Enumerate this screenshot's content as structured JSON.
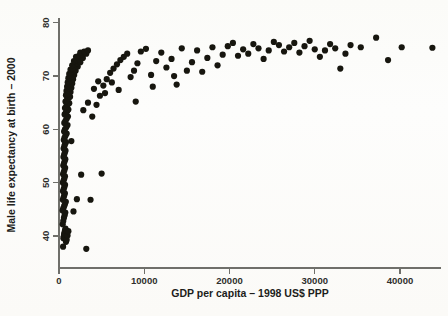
{
  "figure": {
    "background_color": "#fdfdfb",
    "point_color": "#17160f",
    "axis_color": "#6f6f6a",
    "text_color": "#1d1d1b"
  },
  "chart_data": {
    "type": "scatter",
    "title": "",
    "xlabel": "GDP per capita – 1998 US$ PPP",
    "ylabel": "Male life expectancy at birth – 2000",
    "xlim": [
      -1500,
      45500
    ],
    "ylim": [
      36.2,
      81.5
    ],
    "xticks": [
      0,
      10000,
      20000,
      30000,
      40000
    ],
    "xtick_labels": [
      "0",
      "10000",
      "20000",
      "30000",
      "40000"
    ],
    "yticks": [
      40,
      50,
      60,
      70,
      80
    ],
    "ytick_labels": [
      "40",
      "50",
      "60",
      "70",
      "80"
    ],
    "grid": false,
    "legend": null,
    "marker": "filled-circle",
    "marker_size_px": 4.0,
    "n_points": 191,
    "points": [
      [
        480,
        38.0
      ],
      [
        520,
        39.6
      ],
      [
        560,
        39.9
      ],
      [
        600,
        40.3
      ],
      [
        640,
        40.6
      ],
      [
        700,
        41.0
      ],
      [
        760,
        41.4
      ],
      [
        820,
        38.9
      ],
      [
        900,
        39.3
      ],
      [
        1000,
        40.1
      ],
      [
        1100,
        40.9
      ],
      [
        430,
        42.2
      ],
      [
        500,
        42.8
      ],
      [
        580,
        43.4
      ],
      [
        660,
        43.9
      ],
      [
        740,
        44.4
      ],
      [
        420,
        44.8
      ],
      [
        500,
        45.2
      ],
      [
        600,
        45.6
      ],
      [
        700,
        46.0
      ],
      [
        800,
        46.4
      ],
      [
        450,
        46.8
      ],
      [
        530,
        47.2
      ],
      [
        610,
        47.6
      ],
      [
        690,
        48.0
      ],
      [
        470,
        48.4
      ],
      [
        550,
        48.8
      ],
      [
        630,
        49.2
      ],
      [
        710,
        49.6
      ],
      [
        460,
        50.0
      ],
      [
        540,
        50.4
      ],
      [
        620,
        50.8
      ],
      [
        700,
        51.2
      ],
      [
        480,
        51.6
      ],
      [
        560,
        52.0
      ],
      [
        640,
        52.4
      ],
      [
        720,
        52.8
      ],
      [
        500,
        53.2
      ],
      [
        580,
        53.6
      ],
      [
        660,
        54.0
      ],
      [
        740,
        54.4
      ],
      [
        520,
        54.8
      ],
      [
        600,
        55.2
      ],
      [
        680,
        55.6
      ],
      [
        760,
        56.0
      ],
      [
        540,
        56.4
      ],
      [
        620,
        56.8
      ],
      [
        700,
        57.2
      ],
      [
        820,
        57.6
      ],
      [
        560,
        58.0
      ],
      [
        640,
        58.4
      ],
      [
        760,
        58.8
      ],
      [
        900,
        59.2
      ],
      [
        600,
        59.6
      ],
      [
        700,
        60.0
      ],
      [
        850,
        60.4
      ],
      [
        1000,
        60.8
      ],
      [
        620,
        61.2
      ],
      [
        760,
        61.6
      ],
      [
        900,
        62.0
      ],
      [
        1050,
        62.4
      ],
      [
        660,
        62.8
      ],
      [
        800,
        63.1
      ],
      [
        950,
        63.4
      ],
      [
        1100,
        63.7
      ],
      [
        700,
        64.0
      ],
      [
        850,
        64.3
      ],
      [
        1000,
        64.6
      ],
      [
        1200,
        64.9
      ],
      [
        760,
        65.2
      ],
      [
        920,
        65.5
      ],
      [
        1080,
        65.8
      ],
      [
        1300,
        66.1
      ],
      [
        820,
        66.4
      ],
      [
        980,
        66.6
      ],
      [
        1150,
        66.8
      ],
      [
        1350,
        67.0
      ],
      [
        880,
        67.2
      ],
      [
        1050,
        67.4
      ],
      [
        1250,
        67.6
      ],
      [
        1450,
        67.8
      ],
      [
        950,
        68.0
      ],
      [
        1120,
        68.2
      ],
      [
        1320,
        68.4
      ],
      [
        1550,
        68.6
      ],
      [
        1020,
        68.8
      ],
      [
        1200,
        69.0
      ],
      [
        1400,
        69.2
      ],
      [
        1650,
        69.4
      ],
      [
        1100,
        69.6
      ],
      [
        1300,
        69.8
      ],
      [
        1520,
        70.0
      ],
      [
        1780,
        70.2
      ],
      [
        1200,
        70.4
      ],
      [
        1420,
        70.6
      ],
      [
        1680,
        70.8
      ],
      [
        1950,
        71.0
      ],
      [
        1350,
        71.2
      ],
      [
        1600,
        71.4
      ],
      [
        1880,
        71.6
      ],
      [
        2200,
        71.8
      ],
      [
        1550,
        72.0
      ],
      [
        1850,
        72.2
      ],
      [
        2150,
        72.4
      ],
      [
        2500,
        72.6
      ],
      [
        1750,
        72.8
      ],
      [
        2050,
        73.0
      ],
      [
        2400,
        73.2
      ],
      [
        2800,
        73.4
      ],
      [
        2000,
        73.6
      ],
      [
        2350,
        73.8
      ],
      [
        2750,
        74.0
      ],
      [
        3200,
        74.2
      ],
      [
        2500,
        74.4
      ],
      [
        2950,
        74.6
      ],
      [
        3400,
        74.8
      ],
      [
        1450,
        57.8
      ],
      [
        1700,
        44.6
      ],
      [
        2100,
        46.9
      ],
      [
        3200,
        37.6
      ],
      [
        2600,
        51.5
      ],
      [
        5000,
        51.7
      ],
      [
        3700,
        46.8
      ],
      [
        3900,
        62.4
      ],
      [
        4400,
        64.6
      ],
      [
        4800,
        66.3
      ],
      [
        5200,
        68.2
      ],
      [
        5600,
        69.4
      ],
      [
        6000,
        70.6
      ],
      [
        6400,
        71.4
      ],
      [
        6800,
        72.2
      ],
      [
        7200,
        73.0
      ],
      [
        7600,
        73.6
      ],
      [
        8000,
        74.2
      ],
      [
        8400,
        69.8
      ],
      [
        8800,
        71.0
      ],
      [
        9200,
        72.4
      ],
      [
        9600,
        74.6
      ],
      [
        10200,
        75.1
      ],
      [
        10800,
        70.2
      ],
      [
        11400,
        72.8
      ],
      [
        12000,
        74.4
      ],
      [
        12600,
        71.6
      ],
      [
        13200,
        73.2
      ],
      [
        13800,
        68.4
      ],
      [
        14400,
        75.2
      ],
      [
        15000,
        71.0
      ],
      [
        15600,
        72.6
      ],
      [
        16200,
        74.8
      ],
      [
        16800,
        70.8
      ],
      [
        17400,
        73.4
      ],
      [
        18000,
        75.4
      ],
      [
        18600,
        72.0
      ],
      [
        19200,
        74.0
      ],
      [
        19800,
        75.6
      ],
      [
        20400,
        76.2
      ],
      [
        21000,
        73.8
      ],
      [
        21600,
        75.0
      ],
      [
        22200,
        74.2
      ],
      [
        22800,
        76.0
      ],
      [
        23400,
        75.2
      ],
      [
        24000,
        73.2
      ],
      [
        24600,
        74.8
      ],
      [
        25200,
        76.4
      ],
      [
        25800,
        75.8
      ],
      [
        26400,
        74.6
      ],
      [
        27000,
        75.4
      ],
      [
        27600,
        76.2
      ],
      [
        28200,
        74.4
      ],
      [
        28800,
        75.6
      ],
      [
        29400,
        76.6
      ],
      [
        30000,
        75.0
      ],
      [
        30600,
        73.6
      ],
      [
        31200,
        74.8
      ],
      [
        31800,
        76.0
      ],
      [
        32400,
        75.2
      ],
      [
        33000,
        71.4
      ],
      [
        33600,
        74.2
      ],
      [
        34200,
        75.8
      ],
      [
        35400,
        75.4
      ],
      [
        37200,
        77.2
      ],
      [
        38600,
        73.0
      ],
      [
        40200,
        75.4
      ],
      [
        43800,
        75.3
      ],
      [
        2850,
        63.6
      ],
      [
        3400,
        65.0
      ],
      [
        4100,
        67.6
      ],
      [
        4600,
        69.0
      ],
      [
        5400,
        66.8
      ],
      [
        6200,
        68.8
      ],
      [
        7000,
        67.4
      ],
      [
        9000,
        65.2
      ],
      [
        11000,
        68.0
      ],
      [
        13500,
        70.0
      ]
    ]
  }
}
